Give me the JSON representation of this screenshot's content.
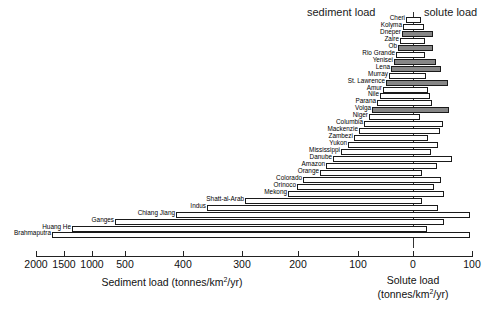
{
  "chart_data": {
    "type": "bar",
    "title": "",
    "subtitle": "",
    "orientation": "horizontal-diverging",
    "left_header": "sediment load",
    "right_header": "solute load",
    "xlabel_left": "Sediment load (tonnes/km2/yr)",
    "xlabel_right": "Solute load (tonnes/km2/yr)",
    "xlabel_left_parts": {
      "text": "Sediment load (tonnes/km",
      "sup": "2",
      "tail": "/yr)"
    },
    "xlabel_right_line1": "Solute load",
    "xlabel_right_parts": {
      "head": "(tonnes/km",
      "sup": "2",
      "tail": "/yr)"
    },
    "ylabel": "",
    "grid": false,
    "legend": "none",
    "axis_note": "broken/compressed axis below 500",
    "tick_labels_left": [
      "2000",
      "1500",
      "1000",
      "500",
      "400",
      "300",
      "200",
      "100",
      "0"
    ],
    "tick_labels_right": [
      "100"
    ],
    "tick_positions_px": [
      36,
      64,
      92,
      125,
      183,
      242,
      298,
      358,
      413,
      472
    ],
    "tick_values": [
      2000,
      1500,
      1000,
      500,
      400,
      300,
      200,
      100,
      0,
      100
    ],
    "zero_px": 413,
    "categories": [
      "Cheri",
      "Kolyma",
      "Dneper",
      "Zaire",
      "Ob",
      "Rio Grande",
      "Yenisei",
      "Lena",
      "Murray",
      "St. Lawrence",
      "Amur",
      "Nile",
      "Parana",
      "Volga",
      "Niger",
      "Columbia",
      "Mackenzie",
      "Zambezi",
      "Yukon",
      "Mississippi",
      "Danube",
      "Amazon",
      "Orange",
      "Colorado",
      "Orinoco",
      "Mekong",
      "Shatt-al-Arab",
      "Indus",
      "Chiang Jiang",
      "Ganges",
      "Huang He",
      "Brahmaputra"
    ],
    "series": [
      {
        "name": "Sediment load",
        "unit": "tonnes/km2/yr",
        "side": "left",
        "values": [
          5,
          6,
          9,
          12,
          15,
          18,
          21,
          25,
          28,
          31,
          36,
          40,
          44,
          50,
          55,
          62,
          68,
          77,
          86,
          96,
          108,
          120,
          130,
          160,
          170,
          185,
          260,
          330,
          490,
          1080,
          1700,
          2100
        ]
      },
      {
        "name": "Solute load",
        "unit": "tonnes/km2/yr",
        "side": "right",
        "values": [
          7,
          9,
          34,
          11,
          33,
          14,
          38,
          48,
          16,
          60,
          18,
          20,
          22,
          62,
          8,
          52,
          46,
          26,
          44,
          30,
          68,
          42,
          13,
          50,
          36,
          56,
          16,
          42,
          55,
          48,
          22,
          42
        ]
      }
    ],
    "bars": [
      {
        "label": "Cheri",
        "fill": "white",
        "x0": 406,
        "x1": 421
      },
      {
        "label": "Kolyma",
        "fill": "white",
        "x0": 403,
        "x1": 424
      },
      {
        "label": "Dneper",
        "fill": "gray",
        "x0": 402,
        "x1": 433
      },
      {
        "label": "Zaire",
        "fill": "white",
        "x0": 400,
        "x1": 425
      },
      {
        "label": "Ob",
        "fill": "gray",
        "x0": 398,
        "x1": 433
      },
      {
        "label": "Rio Grande",
        "fill": "white",
        "x0": 396,
        "x1": 425
      },
      {
        "label": "Yenisei",
        "fill": "gray",
        "x0": 394,
        "x1": 436
      },
      {
        "label": "Lena",
        "fill": "gray",
        "x0": 391,
        "x1": 441
      },
      {
        "label": "Murray",
        "fill": "white",
        "x0": 389,
        "x1": 426
      },
      {
        "label": "St. Lawrence",
        "fill": "gray",
        "x0": 386,
        "x1": 448
      },
      {
        "label": "Amur",
        "fill": "white",
        "x0": 383,
        "x1": 428
      },
      {
        "label": "Nile",
        "fill": "white",
        "x0": 380,
        "x1": 430
      },
      {
        "label": "Parana",
        "fill": "white",
        "x0": 377,
        "x1": 432
      },
      {
        "label": "Volga",
        "fill": "gray",
        "x0": 372,
        "x1": 449
      },
      {
        "label": "Niger",
        "fill": "white",
        "x0": 369,
        "x1": 420
      },
      {
        "label": "Columbia",
        "fill": "white",
        "x0": 364,
        "x1": 443
      },
      {
        "label": "Mackenzie",
        "fill": "white",
        "x0": 359,
        "x1": 440
      },
      {
        "label": "Zambezi",
        "fill": "white",
        "x0": 354,
        "x1": 428
      },
      {
        "label": "Yukon",
        "fill": "white",
        "x0": 348,
        "x1": 438
      },
      {
        "label": "Mississippi",
        "fill": "white",
        "x0": 341,
        "x1": 431
      },
      {
        "label": "Danube",
        "fill": "white",
        "x0": 333,
        "x1": 452
      },
      {
        "label": "Amazon",
        "fill": "white",
        "x0": 326,
        "x1": 437
      },
      {
        "label": "Orange",
        "fill": "white",
        "x0": 320,
        "x1": 422
      },
      {
        "label": "Colorado",
        "fill": "white",
        "x0": 303,
        "x1": 441
      },
      {
        "label": "Orinoco",
        "fill": "white",
        "x0": 297,
        "x1": 434
      },
      {
        "label": "Mekong",
        "fill": "white",
        "x0": 288,
        "x1": 444
      },
      {
        "label": "Shatt-al-Arab",
        "fill": "white",
        "x0": 245,
        "x1": 422
      },
      {
        "label": "Indus",
        "fill": "white",
        "x0": 207,
        "x1": 438
      },
      {
        "label": "Chiang Jiang",
        "fill": "white",
        "x0": 176,
        "x1": 470
      },
      {
        "label": "Ganges",
        "fill": "white",
        "x0": 115,
        "x1": 444
      },
      {
        "label": "Huang He",
        "fill": "white",
        "x0": 72,
        "x1": 427
      },
      {
        "label": "Brahmaputra",
        "fill": "white",
        "x0": 52,
        "x1": 470
      }
    ]
  }
}
